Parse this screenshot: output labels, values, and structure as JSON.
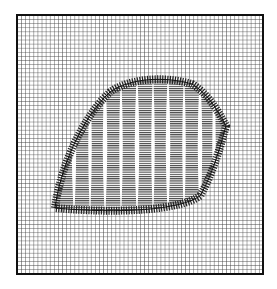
{
  "figure": {
    "colors": {
      "background": "#ffffff",
      "ink": "#1a1a1a",
      "grid": "#333333"
    },
    "frame": {
      "x": 17,
      "y": 15,
      "width": 246,
      "height": 259
    },
    "grid_spacing": 4.1,
    "leaf": {
      "outline_path": "M 55 208 C 60 170, 80 120, 110 92 C 130 78, 165 76, 192 84 C 206 92, 218 110, 226 126 C 222 140, 214 172, 200 196 C 180 210, 120 214, 55 208 Z",
      "stripe_gaps_x": [
        74,
        90,
        105,
        121,
        137,
        153,
        168,
        184,
        200,
        214
      ]
    }
  }
}
